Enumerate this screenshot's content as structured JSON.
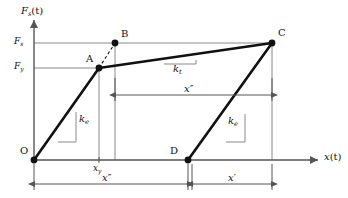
{
  "figure": {
    "type": "diagram",
    "axes": {
      "y_label": "F",
      "y_label_sub": "s",
      "y_label_tail": "(t)",
      "x_label": "x",
      "x_label_tail": "(t)"
    },
    "y_ticks": [
      {
        "name": "Fs",
        "base": "F",
        "sub": "s",
        "y": 43
      },
      {
        "name": "Fy",
        "base": "F",
        "sub": "y",
        "y": 68
      }
    ],
    "x_ticks": [
      {
        "name": "xy",
        "base": "x",
        "sub": "y",
        "x": 99
      }
    ],
    "points": [
      {
        "id": "O",
        "label": "O",
        "x": 34,
        "y": 160,
        "dot": true
      },
      {
        "id": "A",
        "label": "A",
        "x": 99,
        "y": 68,
        "dot": true
      },
      {
        "id": "B",
        "label": "B",
        "x": 115,
        "y": 43,
        "dot": true
      },
      {
        "id": "C",
        "label": "C",
        "x": 272,
        "y": 43,
        "dot": true
      },
      {
        "id": "D",
        "label": "D",
        "x": 188,
        "y": 160,
        "dot": true
      }
    ],
    "segments": [
      {
        "name": "O-A elastic branch",
        "from": "O",
        "to": "A",
        "style": "solid",
        "width": 2.6
      },
      {
        "name": "A-B dashed",
        "from": "A",
        "to": "B",
        "style": "dashed",
        "width": 1.1
      },
      {
        "name": "A-C tangent branch",
        "from": "A",
        "to": "C",
        "style": "solid",
        "width": 2.6
      },
      {
        "name": "D-C unloading branch",
        "from": "D",
        "to": "C",
        "style": "solid",
        "width": 2.6
      }
    ],
    "slope_labels": [
      {
        "name": "ke-left",
        "base": "k",
        "sub": "e",
        "x": 64,
        "y": 118
      },
      {
        "name": "kt",
        "base": "k",
        "sub": "t",
        "x": 175,
        "y": 69
      },
      {
        "name": "ke-right",
        "base": "k",
        "sub": "e",
        "x": 233,
        "y": 120
      }
    ],
    "dimensions": [
      {
        "name": "x-double-prime-mid",
        "base": "x",
        "prime": "″",
        "x1": 115,
        "x2": 272,
        "y": 95,
        "label_x": 188
      },
      {
        "name": "x-double-prime-bottom",
        "base": "x",
        "prime": "″",
        "x1": 34,
        "x2": 188,
        "y": 184,
        "label_x": 106
      },
      {
        "name": "x-prime-bottom",
        "base": "x",
        "prime": "′",
        "x1": 192,
        "x2": 272,
        "y": 184,
        "label_x": 232
      }
    ],
    "colors": {
      "curve": "#111111",
      "guide": "#8a8a8a",
      "axis": "#555555",
      "background": "#ffffff"
    }
  }
}
